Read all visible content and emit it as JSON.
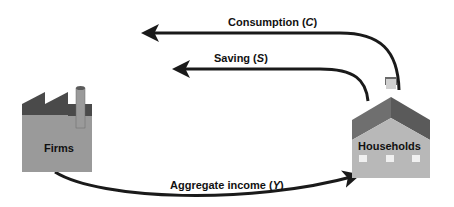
{
  "diagram": {
    "type": "circular-flow",
    "nodes": {
      "firms": {
        "label": "Firms",
        "icon": "factory-icon"
      },
      "households": {
        "label": "Households",
        "icon": "house-icon"
      }
    },
    "flows": {
      "consumption": {
        "prefix": "Consumption (",
        "symbol": "C",
        "suffix": ")"
      },
      "saving": {
        "prefix": "Saving (",
        "symbol": "S",
        "suffix": ")"
      },
      "income": {
        "prefix": "Aggregate income (",
        "symbol": "Y",
        "suffix": ")"
      }
    },
    "colors": {
      "arrow": "#1a1a1a",
      "factory_body": "#9a9a9a",
      "factory_roof": "#4a4a4a",
      "house_roof": "#6a6a6a",
      "house_body": "#b5b5b5"
    }
  }
}
